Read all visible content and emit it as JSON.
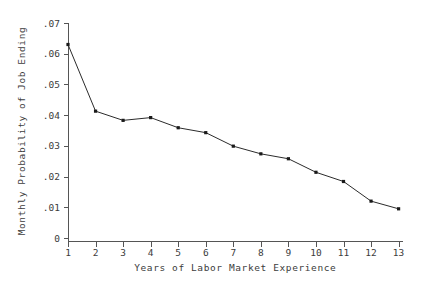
{
  "chart_data": {
    "type": "line",
    "title": "",
    "xlabel": "Years of Labor Market Experience",
    "ylabel": "Monthly Probability of Job Ending",
    "x": [
      1,
      2,
      3,
      4,
      5,
      6,
      7,
      8,
      9,
      10,
      11,
      12,
      13
    ],
    "values": [
      0.063,
      0.0413,
      0.0383,
      0.0392,
      0.0359,
      0.0343,
      0.0299,
      0.0274,
      0.0258,
      0.0214,
      0.0184,
      0.012,
      0.0095
    ],
    "series": [
      {
        "name": "Monthly Probability of Job Ending",
        "values": [
          0.063,
          0.0413,
          0.0383,
          0.0392,
          0.0359,
          0.0343,
          0.0299,
          0.0274,
          0.0258,
          0.0214,
          0.0184,
          0.012,
          0.0095
        ]
      }
    ],
    "xticklabels": [
      "1",
      "2",
      "3",
      "4",
      "5",
      "6",
      "7",
      "8",
      "9",
      "10",
      "11",
      "12",
      "13"
    ],
    "yticklabels": [
      "0",
      ".01",
      ".02",
      ".03",
      ".04",
      ".05",
      ".06",
      ".07"
    ],
    "ytickvalues": [
      0,
      0.01,
      0.02,
      0.03,
      0.04,
      0.05,
      0.06,
      0.07
    ],
    "xlim": [
      0.5,
      13.6
    ],
    "ylim": [
      0,
      0.07
    ],
    "grid": false,
    "legend": null,
    "marker": "filled-square",
    "line_color": "#2b2b2b",
    "marker_color": "#1a1a1a",
    "axis_color": "#555555",
    "text_color": "#3c3c3c",
    "background": "#ffffff"
  }
}
